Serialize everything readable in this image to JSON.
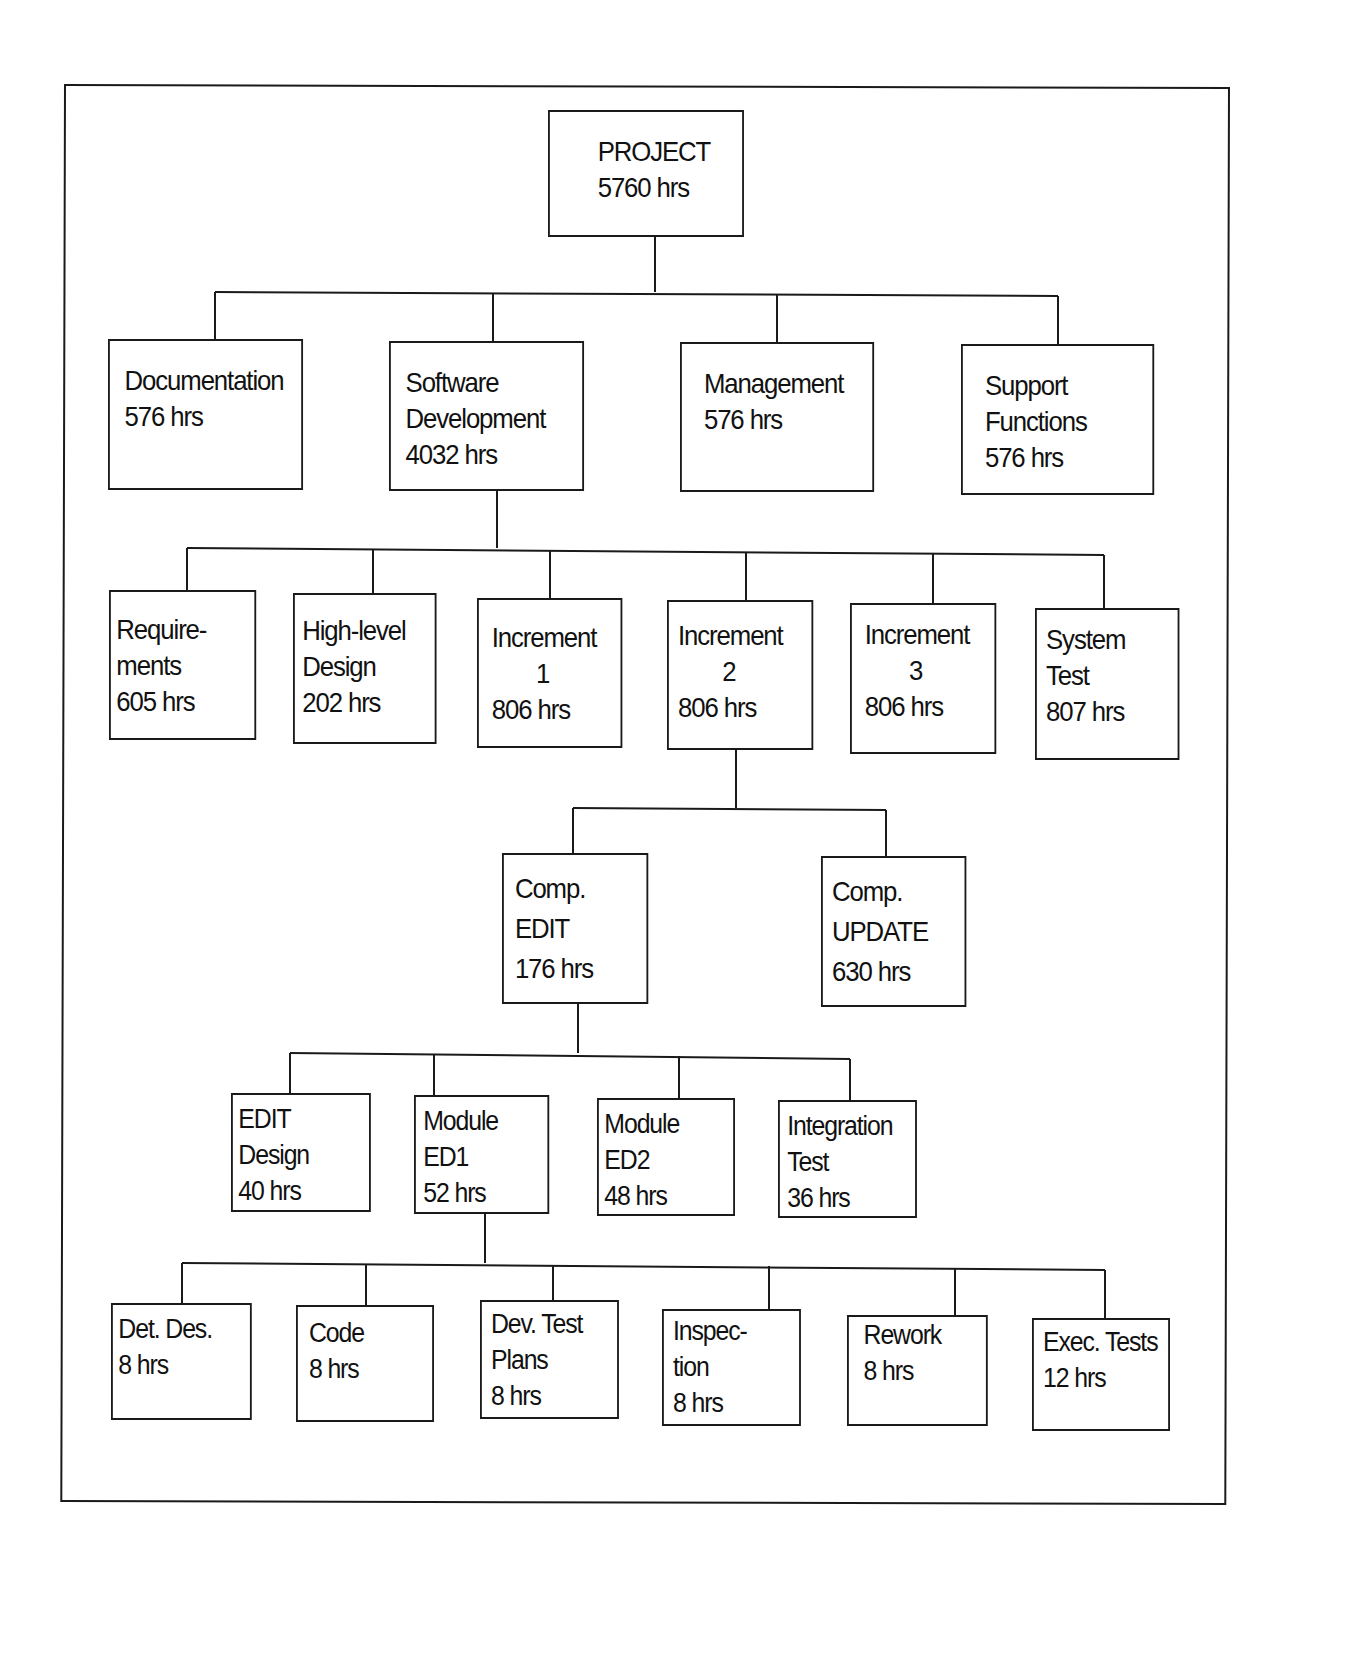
{
  "diagram": {
    "type": "work-breakdown-structure",
    "root": {
      "id": "project",
      "label_lines": [
        "PROJECT"
      ],
      "hours": "5760 hrs"
    },
    "level1": [
      {
        "id": "documentation",
        "label_lines": [
          "Documentation"
        ],
        "hours": "576 hrs"
      },
      {
        "id": "software-development",
        "label_lines": [
          "Software",
          "Development"
        ],
        "hours": "4032 hrs"
      },
      {
        "id": "management",
        "label_lines": [
          "Management"
        ],
        "hours": "576 hrs"
      },
      {
        "id": "support-functions",
        "label_lines": [
          "Support",
          "Functions"
        ],
        "hours": "576 hrs"
      }
    ],
    "level2_parent": "software-development",
    "level2": [
      {
        "id": "requirements",
        "label_lines": [
          "Require-",
          "ments"
        ],
        "hours": "605 hrs"
      },
      {
        "id": "high-level-design",
        "label_lines": [
          "High-level",
          "Design"
        ],
        "hours": "202 hrs"
      },
      {
        "id": "increment-1",
        "label_lines": [
          "Increment",
          "1"
        ],
        "hours": "806 hrs"
      },
      {
        "id": "increment-2",
        "label_lines": [
          "Increment",
          "2"
        ],
        "hours": "806 hrs"
      },
      {
        "id": "increment-3",
        "label_lines": [
          "Increment",
          "3"
        ],
        "hours": "806 hrs"
      },
      {
        "id": "system-test",
        "label_lines": [
          "System",
          "Test"
        ],
        "hours": "807 hrs"
      }
    ],
    "level3_parent": "increment-2",
    "level3": [
      {
        "id": "comp-edit",
        "label_lines": [
          "Comp.",
          "EDIT"
        ],
        "hours": "176 hrs"
      },
      {
        "id": "comp-update",
        "label_lines": [
          "Comp.",
          "UPDATE"
        ],
        "hours": "630 hrs"
      }
    ],
    "level4_parent": "comp-edit",
    "level4": [
      {
        "id": "edit-design",
        "label_lines": [
          "EDIT",
          "Design"
        ],
        "hours": "40 hrs"
      },
      {
        "id": "module-ed1",
        "label_lines": [
          "Module",
          "ED1"
        ],
        "hours": "52 hrs"
      },
      {
        "id": "module-ed2",
        "label_lines": [
          "Module",
          "ED2"
        ],
        "hours": "48 hrs"
      },
      {
        "id": "integration-test",
        "label_lines": [
          "Integration",
          "Test"
        ],
        "hours": "36 hrs"
      }
    ],
    "level5_parent": "module-ed1",
    "level5": [
      {
        "id": "det-des",
        "label_lines": [
          "Det. Des."
        ],
        "hours": "8 hrs"
      },
      {
        "id": "code",
        "label_lines": [
          "Code"
        ],
        "hours": "8 hrs"
      },
      {
        "id": "dev-test-plans",
        "label_lines": [
          "Dev. Test",
          "Plans"
        ],
        "hours": "8 hrs"
      },
      {
        "id": "inspection",
        "label_lines": [
          "Inspec-",
          "tion"
        ],
        "hours": "8 hrs"
      },
      {
        "id": "rework",
        "label_lines": [
          "Rework"
        ],
        "hours": "8 hrs"
      },
      {
        "id": "exec-tests",
        "label_lines": [
          "Exec. Tests"
        ],
        "hours": "12 hrs"
      }
    ]
  }
}
